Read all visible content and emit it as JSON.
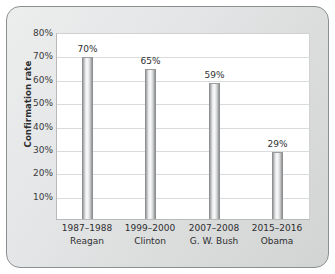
{
  "chart_data": {
    "type": "bar",
    "title": "",
    "xlabel": "",
    "ylabel": "Confirmation rate",
    "categories": [
      "1987–1988\nReagan",
      "1999–2000\nClinton",
      "2007–2008\nG. W. Bush",
      "2015–2016\nObama"
    ],
    "category_lines": [
      {
        "period": "1987–1988",
        "president": "Reagan"
      },
      {
        "period": "1999–2000",
        "president": "Clinton"
      },
      {
        "period": "2007–2008",
        "president": "G. W. Bush"
      },
      {
        "period": "2015–2016",
        "president": "Obama"
      }
    ],
    "values": [
      70,
      65,
      59,
      29
    ],
    "value_labels": [
      "70%",
      "65%",
      "59%",
      "29%"
    ],
    "ylim": [
      0,
      80
    ],
    "yticks": [
      80,
      70,
      60,
      50,
      40,
      30,
      20,
      10
    ],
    "ytick_labels": [
      "80%",
      "70%",
      "60%",
      "50%",
      "40%",
      "30%",
      "20%",
      "10%"
    ],
    "grid": "horizontal",
    "legend": "none",
    "bar_color": "#dcdddd",
    "plot_background": "#ffffff",
    "figure_background": "#e4e5e6",
    "axis_color": "#b7b9bb",
    "grid_color": "#d9dbdc",
    "text_color": "#2e2f31"
  }
}
